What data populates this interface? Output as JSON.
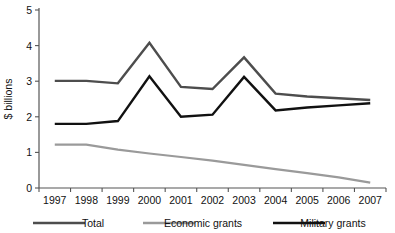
{
  "chart_data": {
    "type": "line",
    "title": "",
    "xlabel": "",
    "ylabel": "$ billions",
    "categories": [
      "1997",
      "1998",
      "1999",
      "2000",
      "2001",
      "2002",
      "2003",
      "2004",
      "2005",
      "2006",
      "2007"
    ],
    "x": [
      1997,
      1998,
      1999,
      2000,
      2001,
      2002,
      2003,
      2004,
      2005,
      2006,
      2007
    ],
    "ylim": [
      0,
      5
    ],
    "yticks": [
      0,
      1,
      2,
      3,
      4,
      5
    ],
    "ytick_labels": [
      "0",
      "1",
      "2",
      "3",
      "4",
      "5"
    ],
    "grid": false,
    "legend_position": "bottom",
    "series": [
      {
        "name": "Total",
        "color": "#4d4d4d",
        "width": 2.4,
        "values": [
          3.01,
          3.01,
          2.94,
          4.08,
          2.84,
          2.78,
          3.67,
          2.65,
          2.57,
          2.52,
          2.47
        ]
      },
      {
        "name": "Economic grants",
        "color": "#9a9a9a",
        "width": 2.2,
        "values": [
          1.22,
          1.22,
          1.08,
          0.97,
          0.87,
          0.77,
          0.65,
          0.53,
          0.42,
          0.3,
          0.15
        ]
      },
      {
        "name": "Military grants",
        "color": "#111111",
        "width": 2.4,
        "values": [
          1.8,
          1.8,
          1.88,
          3.14,
          2.0,
          2.06,
          3.12,
          2.18,
          2.26,
          2.32,
          2.38
        ]
      }
    ]
  },
  "legend": {
    "items": [
      {
        "label": "Total",
        "color": "#4d4d4d"
      },
      {
        "label": "Economic grants",
        "color": "#9a9a9a"
      },
      {
        "label": "Military grants",
        "color": "#111111"
      }
    ]
  },
  "axes": {
    "y_axis_title": "$ billions"
  }
}
